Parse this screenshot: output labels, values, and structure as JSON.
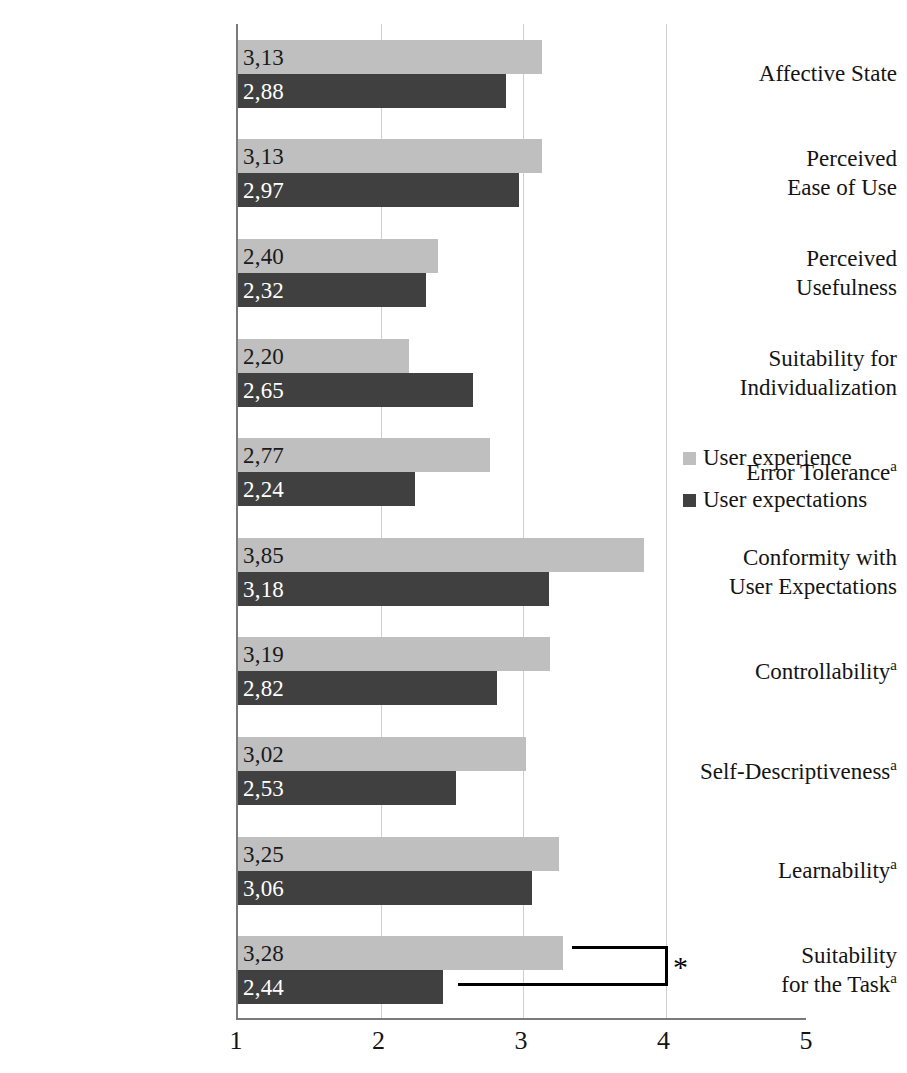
{
  "chart_data": {
    "type": "bar",
    "orientation": "horizontal",
    "title": "",
    "subtitle": "",
    "xlabel": "",
    "ylabel": "",
    "xlim": [
      1,
      5
    ],
    "xticks": [
      "1",
      "2",
      "3",
      "4",
      "5"
    ],
    "grid": true,
    "gridlines_at": [
      2,
      3,
      4
    ],
    "legend_position": "right-middle",
    "categories": [
      "Affective State",
      "Perceived Ease of Use",
      "Perceived Usefulness",
      "Suitability for Individualization",
      "Error Tolerance",
      "Conformity with User Expectations",
      "Controllability",
      "Self-Descriptiveness",
      "Learnability",
      "Suitability for the Task"
    ],
    "series": [
      {
        "name": "User experience",
        "color": "#bfbfbf",
        "values": [
          3.13,
          3.13,
          2.4,
          2.2,
          2.77,
          3.85,
          3.19,
          3.02,
          3.25,
          3.28
        ],
        "value_labels": [
          "3,13",
          "3,13",
          "2,40",
          "2,20",
          "2,77",
          "3,85",
          "3,19",
          "3,02",
          "3,25",
          "3,28"
        ]
      },
      {
        "name": "User expectations",
        "color": "#404040",
        "values": [
          2.88,
          2.97,
          2.32,
          2.65,
          2.24,
          3.18,
          2.82,
          2.53,
          3.06,
          2.44
        ],
        "value_labels": [
          "2,88",
          "2,97",
          "2,32",
          "2,65",
          "2,24",
          "3,18",
          "2,82",
          "2,53",
          "3,06",
          "2,44"
        ]
      }
    ],
    "annotations": [
      {
        "type": "significance-bracket",
        "symbol": "*",
        "category": "Suitability for the Task",
        "between": [
          "User experience",
          "User expectations"
        ]
      }
    ]
  },
  "categories": [
    {
      "line1": "Affective State",
      "line2": "",
      "footnote": ""
    },
    {
      "line1": "Perceived",
      "line2": "Ease of Use",
      "footnote": ""
    },
    {
      "line1": "Perceived",
      "line2": "Usefulness",
      "footnote": ""
    },
    {
      "line1": "Suitability for",
      "line2": "Individualization",
      "footnote": ""
    },
    {
      "line1": "Error Tolerance",
      "line2": "",
      "footnote": "a"
    },
    {
      "line1": "Conformity with",
      "line2": "User Expectations",
      "footnote": ""
    },
    {
      "line1": "Controllability",
      "line2": "",
      "footnote": "a"
    },
    {
      "line1": "Self-Descriptiveness",
      "line2": "",
      "footnote": "a"
    },
    {
      "line1": "Learnability",
      "line2": "",
      "footnote": "a"
    },
    {
      "line1": "Suitability",
      "line2": "for the Task",
      "footnote": "a"
    }
  ],
  "legend": {
    "items": [
      {
        "label": "User experience",
        "color": "#bfbfbf"
      },
      {
        "label": "User expectations",
        "color": "#404040"
      }
    ]
  },
  "axis": {
    "x_tick_labels": [
      "1",
      "2",
      "3",
      "4",
      "5"
    ]
  },
  "annotation": {
    "significance_symbol": "*"
  },
  "colors": {
    "series_light": "#bfbfbf",
    "series_dark": "#404040",
    "axis": "#7a7a7a",
    "grid": "#cfcfcf",
    "text": "#141414",
    "background": "#ffffff"
  }
}
